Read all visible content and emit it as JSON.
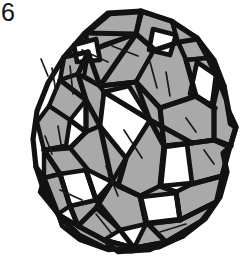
{
  "figure": {
    "label": "6",
    "title": "Woven polyhedral ball assembled from interlocking folded strips",
    "kind": "line-drawing",
    "caption_fragment": " ",
    "colors": {
      "background": "#ffffff",
      "paper_fill": "#a9a9a9",
      "outline": "#121212",
      "crease": "#1a1a1a",
      "hole": "#ffffff",
      "label_text": "#111111"
    },
    "stroke_widths": {
      "outline": 5.2,
      "edge": 4.4,
      "crease": 1.7
    },
    "counts": {
      "visible_facets": 34,
      "open_windows": 7,
      "crease_marks": 14
    }
  },
  "geometry": {
    "outer_silhouette": "M 108 12 L 140 11 L 170 20 L 196 37 L 214 60 L 224 86 L 228 112 L 236 126 L 232 146 L 224 152 L 228 170 L 222 196 L 206 218 L 184 235 L 160 246 L 132 250 L 104 246 L 80 234 L 60 216 L 45 193 L 36 166 L 33 138 L 37 110 L 48 82 L 64 56 L 84 32 Z",
    "windows": [
      "M 104 92 L 129 86 L 150 120 L 126 158 L 100 126 Z",
      "M 60 174 L 86 170 L 96 200 L 70 206 Z",
      "M 164 146 L 186 143 L 192 184 L 160 186 Z",
      "M 140 196 L 176 192 L 180 220 L 146 224 Z",
      "M 196 60 L 216 74 L 212 106 L 190 94 Z",
      "M 72 44 L 96 38 L 100 60 L 76 62 Z",
      "M 152 28 L 176 34 L 170 56 L 148 50 Z"
    ],
    "facet_count": 34
  }
}
